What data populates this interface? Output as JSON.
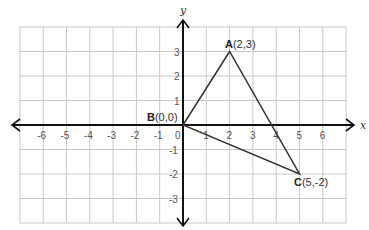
{
  "diagram": {
    "type": "coordinate-plane",
    "axes": {
      "x_label": "x",
      "y_label": "y",
      "x_ticks": [
        "-6",
        "-5",
        "-4",
        "-3",
        "-2",
        "-1",
        "0",
        "1",
        "2",
        "3",
        "4",
        "5",
        "6"
      ],
      "y_ticks_positive": [
        "3",
        "2",
        "1"
      ],
      "y_ticks_negative": [
        "-1",
        "-2",
        "-3"
      ],
      "x_range": [
        -7,
        7
      ],
      "y_range": [
        -4,
        4
      ]
    },
    "points": [
      {
        "name": "A",
        "coord": "(2,3)",
        "x": 2,
        "y": 3
      },
      {
        "name": "B",
        "coord": "(0,0)",
        "x": 0,
        "y": 0
      },
      {
        "name": "C",
        "coord": "(5,-2)",
        "x": 5,
        "y": -2
      }
    ],
    "shape": "triangle ABC",
    "colors": {
      "grid": "#c8c8c8",
      "axis": "#111111",
      "triangle": "#333333"
    }
  }
}
